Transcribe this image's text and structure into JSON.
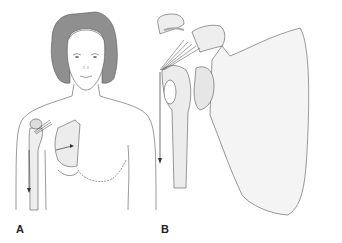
{
  "figure": {
    "panels": [
      {
        "id": "A",
        "label": "A",
        "description": "Front view of female torso with right shoulder anatomy overlay showing humerus, scapula and ligaments; arrows indicate downward pull on arm and rotation of scapula"
      },
      {
        "id": "B",
        "label": "B",
        "description": "Enlarged view of shoulder joint: acromion, coracoid process, glenoid, scapula with ligament fibers; arrow indicates downward traction of humerus"
      }
    ],
    "colors": {
      "line": "#555555",
      "hair": "#8a8a8a",
      "shade": "#d8d8d8",
      "background": "#ffffff"
    }
  }
}
